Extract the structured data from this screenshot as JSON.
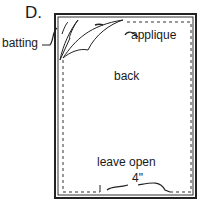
{
  "figure": {
    "step_label": "D.",
    "labels": {
      "batting": "batting",
      "applique": "applique",
      "back": "back",
      "leave_open": "leave open",
      "measurement": "4\""
    }
  }
}
